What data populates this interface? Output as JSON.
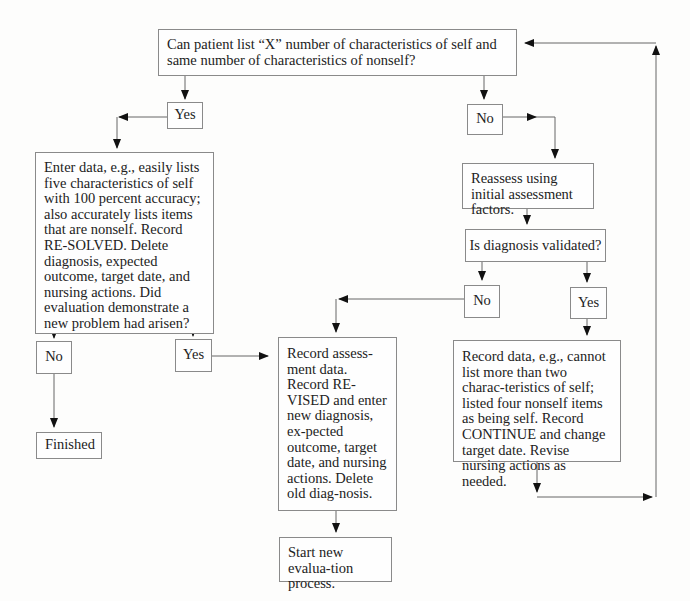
{
  "diagram": {
    "type": "flowchart",
    "nodes": {
      "q_start": "Can patient list “X” number of characteristics of self and same number of characteristics of nonself?",
      "yes_1": "Yes",
      "no_1": "No",
      "enter_data": "Enter data, e.g., easily lists five characteristics of self with 100 percent accuracy; also accurately lists items that are nonself. Record RE-SOLVED. Delete diagnosis, expected outcome, target date, and nursing actions. Did evaluation demonstrate a new problem had arisen?",
      "reassess": "Reassess using initial assessment factors.",
      "q_validated": "Is diagnosis validated?",
      "no_2": "No",
      "yes_2": "Yes",
      "no_3": "No",
      "yes_3": "Yes",
      "finished": "Finished",
      "record_assessment": "Record assess-ment data. Record RE-VISED and enter new diagnosis, ex-pected outcome, target date, and nursing actions. Delete old diag-nosis.",
      "record_data": "Record data, e.g., cannot list more than two charac-teristics of self; listed four nonself items as being self. Record CONTINUE and change target date. Revise nursing actions as needed.",
      "start_new": "Start new evalua-tion process."
    },
    "edges": [
      {
        "from": "q_start",
        "to": "yes_1"
      },
      {
        "from": "q_start",
        "to": "no_1"
      },
      {
        "from": "yes_1",
        "to": "enter_data"
      },
      {
        "from": "no_1",
        "to": "reassess"
      },
      {
        "from": "reassess",
        "to": "q_validated"
      },
      {
        "from": "q_validated",
        "to": "no_2"
      },
      {
        "from": "q_validated",
        "to": "yes_2"
      },
      {
        "from": "no_2",
        "to": "record_assessment"
      },
      {
        "from": "yes_2",
        "to": "record_data"
      },
      {
        "from": "record_data",
        "to": "q_start"
      },
      {
        "from": "enter_data",
        "to": "no_3"
      },
      {
        "from": "enter_data",
        "to": "yes_3"
      },
      {
        "from": "no_3",
        "to": "finished"
      },
      {
        "from": "yes_3",
        "to": "record_assessment"
      },
      {
        "from": "record_assessment",
        "to": "start_new"
      }
    ],
    "colors": {
      "line": "#555555",
      "border": "#8a8a8a",
      "text": "#222222",
      "background": "#fdfdfc"
    }
  }
}
